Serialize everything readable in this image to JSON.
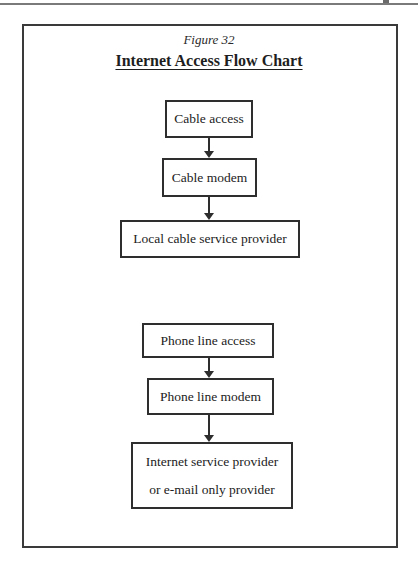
{
  "figure": {
    "label": "Figure 32",
    "title": "Internet Access Flow Chart"
  },
  "flows": [
    {
      "name": "cable",
      "nodes": [
        {
          "label": "Cable access"
        },
        {
          "label": "Cable modem"
        },
        {
          "label": "Local cable service provider"
        }
      ]
    },
    {
      "name": "phone",
      "nodes": [
        {
          "label": "Phone line access"
        },
        {
          "label": "Phone line modem"
        },
        {
          "label": "Internet service provider",
          "label2": "or e-mail only provider"
        }
      ]
    }
  ],
  "edges": [
    {
      "from": "Cable access",
      "to": "Cable modem"
    },
    {
      "from": "Cable modem",
      "to": "Local cable service provider"
    },
    {
      "from": "Phone line access",
      "to": "Phone line modem"
    },
    {
      "from": "Phone line modem",
      "to": "Internet service provider or e-mail only provider"
    }
  ]
}
